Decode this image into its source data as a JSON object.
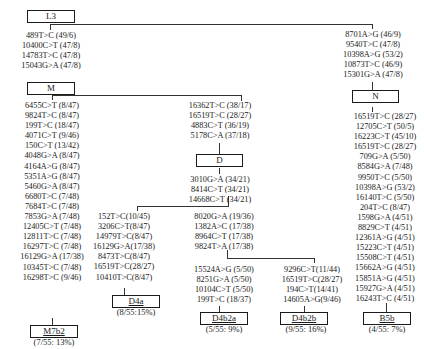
{
  "nodes": {
    "L3": {
      "label": "L3"
    },
    "M": {
      "label": "M"
    },
    "N": {
      "label": "N"
    },
    "D": {
      "label": "D"
    },
    "M7b2": {
      "label": "M7b2",
      "caption": "(7/55: 13%)"
    },
    "D4a": {
      "label": "D4a",
      "caption": "(8/55:15%)"
    },
    "D4b2a": {
      "label": "D4b2a",
      "caption": "(5/55: 9%)"
    },
    "D4b2b": {
      "label": "D4b2b",
      "caption": "(9/55: 16%)"
    },
    "B5b": {
      "label": "B5b",
      "caption": "(4/55: 7%)"
    }
  },
  "mutations": {
    "L3_to_M": [
      "489T>C (49/6)",
      "10400C>T (47/8)",
      "14783T>C (47/8)",
      "15043G>A (47/8)"
    ],
    "L3_to_N": [
      "8701A>G (46/9)",
      "9540T>C (47/8)",
      "10398A>G (53/2)",
      "10873T>C (46/9)",
      "15301G>A (47/8)"
    ],
    "M_to_M7b2": [
      "6455C>T (8/47)",
      "9824T>C (8/47)",
      "199T>C (18/47)",
      "4071C>T (9/46)",
      "150C>T (13/42)",
      "4048G>A (8/47)",
      "4164A>G (8/47)",
      "5351A>G (8/47)",
      "5460G>A (8/47)",
      "6680T>C (7/48)",
      "7684T>C (7/48)",
      "7853G>A (7/48)",
      "12405C>T (7/48)",
      "12811T>C (7/48)",
      "16297T>C (7/48)",
      "16129G>A (17/38)",
      "10345T>C (7/48)",
      "16298T>C (9/46)"
    ],
    "M_to_D": [
      "16362T>C (38/17)",
      "16519T>C (28/27)",
      "4883C>T (36/19)",
      "5178C>A (37/18)"
    ],
    "D_to_split": [
      "3010G>A (34/21)",
      "8414C>T (34/21)",
      "14668C>T (34/21)"
    ],
    "D_to_D4a": [
      "152T>C(10/45)",
      "3206C>T(8/47)",
      "14979T>C(8/47)",
      "16129G>A(17/38)",
      "8473T>C(8/47)",
      "16519T>C(28/27)",
      "10410T>C(8/47)"
    ],
    "D_to_D4b2": [
      "8020G>A (19/36)",
      "1382A>C (17/38)",
      "8964C>T (17/38)",
      "9824T>A (17/38)"
    ],
    "D4b2_to_D4b2a": [
      "15524A>G (5/50)",
      "8251G>A (5/50)",
      "10104C>T (5/50)",
      "199T>C (18/37)"
    ],
    "D4b2_to_D4b2b": [
      "9296C>T(11/44)",
      "16519T>C(28/27)",
      "194C>T(14/41)",
      "14605A>G(9/46)"
    ],
    "N_to_B5b": [
      "16519T>C (28/27)",
      "12705C>T (50/5)",
      "16223C>T (45/10)",
      "16519T>C (28/27)",
      "709G>A (5/50)",
      "8584G>A (7/48)",
      "9950T>C (5/50)",
      "10398A>G (53/2)",
      "16140T>C (5/50)",
      "204T>C (8/47)",
      "1598G>A (4/51)",
      "8829C>T (4/51)",
      "12361A>G (4/51)",
      "15223C>T (4/51)",
      "15508C>T (4/51)",
      "15662A>G (4/51)",
      "15851A>G (4/51)",
      "15927G>A (4/51)",
      "16243T>C (4/51)"
    ]
  }
}
